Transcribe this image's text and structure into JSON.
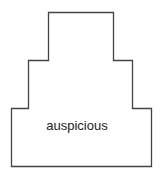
{
  "diagram": {
    "shape": "stepped-tiers",
    "label": "auspicious",
    "stroke_color": "#444444"
  }
}
